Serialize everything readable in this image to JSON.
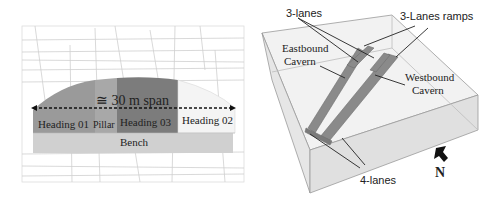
{
  "left_figure": {
    "span_label": "≅ 30 m span",
    "sections": [
      {
        "id": "heading-01",
        "label": "Heading 01",
        "color": "#9a9a9a"
      },
      {
        "id": "pillar",
        "label": "Pillar",
        "color": "#a8a8a8"
      },
      {
        "id": "heading-03",
        "label": "Heading 03",
        "color": "#7c7c7c"
      },
      {
        "id": "heading-02",
        "label": "Heading 02",
        "color": "#f2f2f2"
      }
    ],
    "bench": {
      "label": "Bench",
      "color": "#d0d0d0"
    }
  },
  "right_figure": {
    "labels": {
      "three_lanes": "3-lanes",
      "three_lanes_ramps": "3-Lanes ramps",
      "eastbound": "Eastbound\nCavern",
      "eastbound_line1": "Eastbound",
      "eastbound_line2": "Cavern",
      "westbound_line1": "Westbound",
      "westbound_line2": "Cavern",
      "four_lanes": "4-lanes",
      "north": "N"
    },
    "colors": {
      "cavern": "#8a8a8a",
      "block_face": "#ececec",
      "block_edge": "#9a9a9a"
    }
  }
}
